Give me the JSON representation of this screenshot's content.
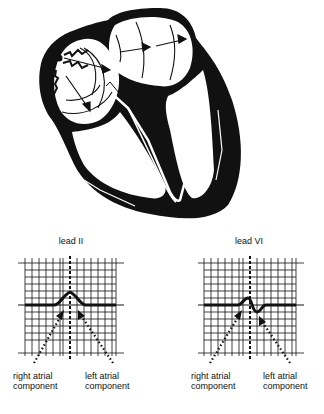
{
  "figure": {
    "heart_diagram": {
      "description": "Cross-section of heart showing sinoatrial node impulse spreading through right atrium to left atrium, with conduction pathway into ventricles",
      "icons": [
        "sa-node-lightning-icon",
        "depolarization-arrow-icon",
        "conduction-pathway-icon"
      ]
    },
    "panels": [
      {
        "title": "lead II",
        "labels": {
          "right": [
            "right atrial",
            "component"
          ],
          "left": [
            "left atrial",
            "component"
          ]
        }
      },
      {
        "title": "lead VI",
        "labels": {
          "right": [
            "right atrial",
            "component"
          ],
          "left": [
            "left atrial",
            "component"
          ]
        }
      }
    ]
  },
  "colors": {
    "ink": "#111111",
    "background": "#ffffff"
  }
}
